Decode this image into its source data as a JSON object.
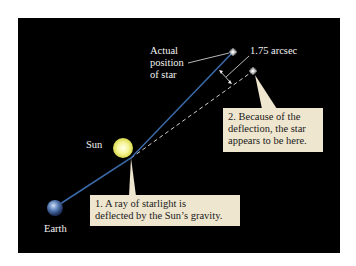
{
  "diagram": {
    "labels": {
      "actual_position": [
        "Actual",
        "position",
        "of star"
      ],
      "deflection_angle": "1.75 arcsec",
      "sun": "Sun",
      "earth": "Earth"
    },
    "callouts": [
      {
        "id": 1,
        "lines": [
          "1. A ray of starlight is",
          "deflected by the Sun’s gravity."
        ]
      },
      {
        "id": 2,
        "lines": [
          "2. Because of the",
          "deflection, the star",
          "appears to be here."
        ]
      }
    ],
    "colors": {
      "background": "#000000",
      "light_ray": "#3a6aa8",
      "apparent_line": "#cfcfcf",
      "callout_fill": "#efe6cf",
      "sun": "#f2f28a",
      "earth": "#5a7fb8"
    }
  }
}
